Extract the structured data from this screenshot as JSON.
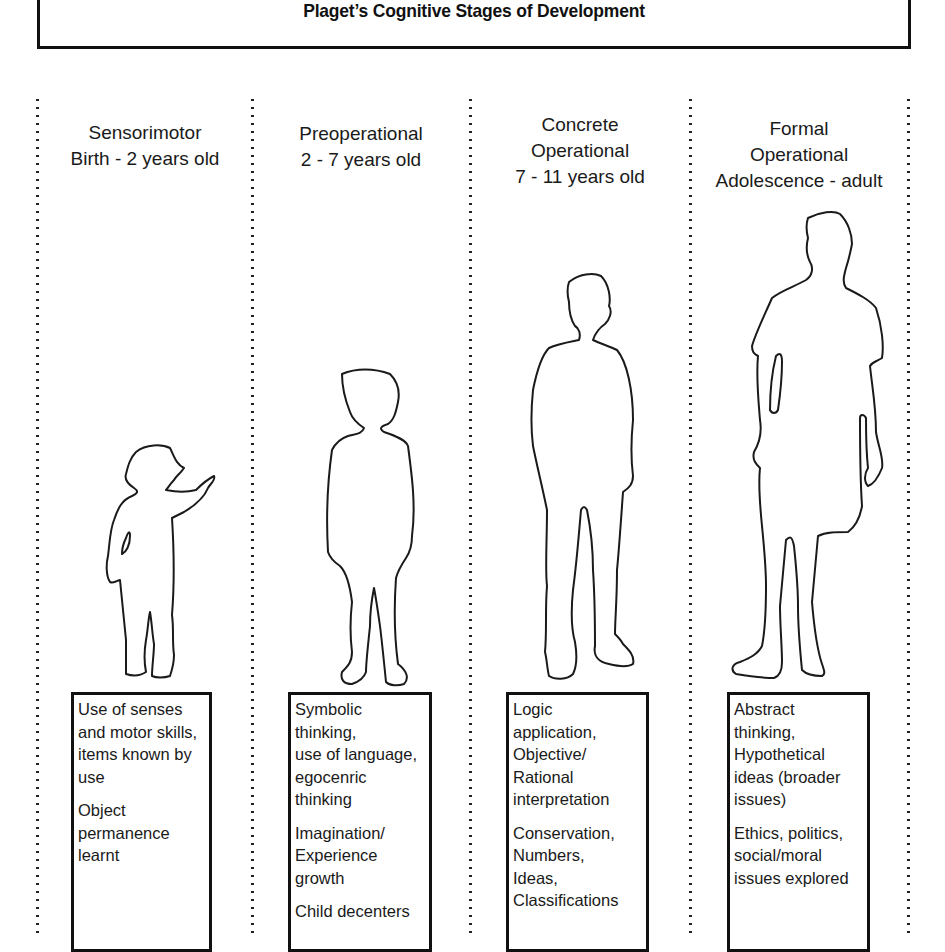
{
  "title": "Plaget’s Cognitive Stages of Development",
  "stages": [
    {
      "name_lines": [
        "Sensorimotor"
      ],
      "age": "Birth - 2 years old",
      "figure": "toddler-pointing-outline",
      "description": [
        "Use of senses\nand motor skills,\nitems known by\nuse",
        "Object\npermanence\nlearnt"
      ]
    },
    {
      "name_lines": [
        "Preoperational"
      ],
      "age": "2 - 7 years old",
      "figure": "young-child-outline",
      "description": [
        "Symbolic\nthinking,\nuse of language,\negocenric\nthinking",
        "Imagination/\nExperience\ngrowth",
        "Child decenters"
      ]
    },
    {
      "name_lines": [
        "Concrete",
        "Operational"
      ],
      "age": "7 - 11 years old",
      "figure": "older-child-outline",
      "description": [
        "Logic\napplication,\nObjective/\nRational\ninterpretation",
        "Conservation,\nNumbers,\nIdeas,\nClassifications"
      ]
    },
    {
      "name_lines": [
        "Formal",
        "Operational"
      ],
      "age": "Adolescence - adult",
      "figure": "adult-outline",
      "description": [
        "Abstract\nthinking,\nHypothetical\nideas (broader\nissues)",
        "Ethics, politics,\nsocial/moral\nissues explored"
      ]
    }
  ]
}
